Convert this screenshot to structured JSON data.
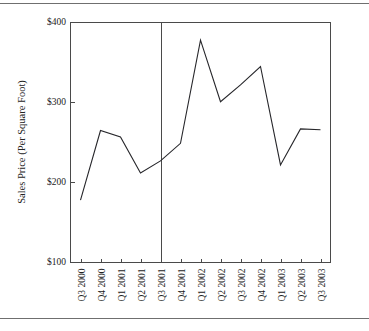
{
  "figure": {
    "name": "sales-price-line-chart",
    "background_color": "#ffffff",
    "rule_color": "#6f6f6f",
    "line_color": "#26262a",
    "axis_color": "#4a4a4a"
  },
  "chart_data": {
    "type": "line",
    "title": "",
    "subtitle": "",
    "xlabel": "",
    "ylabel": "Sales Price (Per Square Foot)",
    "categories": [
      "Q3 2000",
      "Q4 2000",
      "Q1 2001",
      "Q2 2001",
      "Q3 2001",
      "Q4 2001",
      "Q1 2002",
      "Q2 2002",
      "Q3 2002",
      "Q4 2002",
      "Q1 2003",
      "Q2 2003",
      "Q3 2003"
    ],
    "values": [
      178,
      265,
      257,
      212,
      227,
      249,
      378,
      301,
      322,
      345,
      222,
      267,
      266
    ],
    "ylim": [
      100,
      400
    ],
    "ytick_labels": [
      "$400",
      "$300",
      "$200",
      "$100"
    ],
    "ytick_values": [
      400,
      300,
      200,
      100
    ],
    "grid": false,
    "legend": false,
    "legend_position": "none",
    "annotations": [
      {
        "name": "vertical-reference-line",
        "type": "vline",
        "at_category": "Q3 2001",
        "label": ""
      }
    ]
  }
}
